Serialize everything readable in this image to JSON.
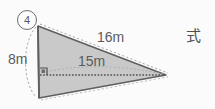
{
  "problem": {
    "number_label": "④",
    "number_value": "4",
    "shape": "triangle",
    "answer_prompt": "式"
  },
  "figure": {
    "fill_color": "#c9c9c9",
    "stroke_color": "#5f5f5f",
    "dotted_color": "#9a9a9a",
    "background_color": "#fbfbfb",
    "text_color": "#5c5c5c",
    "labels": {
      "slant_side": "16m",
      "base": "15m",
      "height": "8m"
    },
    "right_angle_marker": true,
    "vertices": {
      "top_left": [
        38,
        26
      ],
      "bottom_left": [
        39,
        98
      ],
      "right": [
        166,
        75
      ]
    },
    "base_dotted_line": {
      "from": [
        40,
        75
      ],
      "to": [
        166,
        75
      ]
    },
    "height_arc": {
      "from": [
        38,
        26
      ],
      "to": [
        39,
        98
      ]
    }
  }
}
